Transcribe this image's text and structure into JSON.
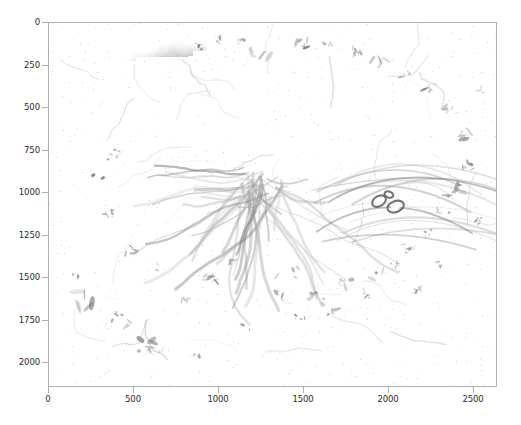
{
  "figure": {
    "background_color": "#ffffff",
    "axes_edge_color": "#b0b0b0",
    "tick_label_color": "#2b2b2b",
    "width_px": 521,
    "height_px": 425
  },
  "chart_data": {
    "type": "heatmap",
    "title": "",
    "xlabel": "",
    "ylabel": "",
    "colormap": "gray",
    "grid": false,
    "legend": null,
    "origin": "upper",
    "xlim": [
      0,
      2640
    ],
    "ylim": [
      2145,
      0
    ],
    "xticks": [
      0,
      500,
      1000,
      1500,
      2000,
      2500
    ],
    "xticklabels": [
      "0",
      "500",
      "1000",
      "1500",
      "2000",
      "2500"
    ],
    "yticks": [
      0,
      250,
      500,
      750,
      1000,
      1250,
      1500,
      1750,
      2000
    ],
    "yticklabels": [
      "0",
      "250",
      "500",
      "750",
      "1000",
      "1250",
      "1500",
      "1750",
      "2000"
    ],
    "value_range": [
      0,
      255
    ],
    "regions": [
      {
        "name": "dark-dense-lobe",
        "x": 600,
        "y": 450,
        "intensity": 90
      },
      {
        "name": "central-hub",
        "x": 1350,
        "y": 900,
        "intensity": 130
      },
      {
        "name": "upper-right-sheet",
        "x": 1500,
        "y": 400,
        "intensity": 165
      },
      {
        "name": "vessel-rings",
        "x": 2000,
        "y": 1000,
        "intensity": 120
      },
      {
        "name": "background",
        "x": 2400,
        "y": 1800,
        "intensity": 255
      }
    ]
  }
}
